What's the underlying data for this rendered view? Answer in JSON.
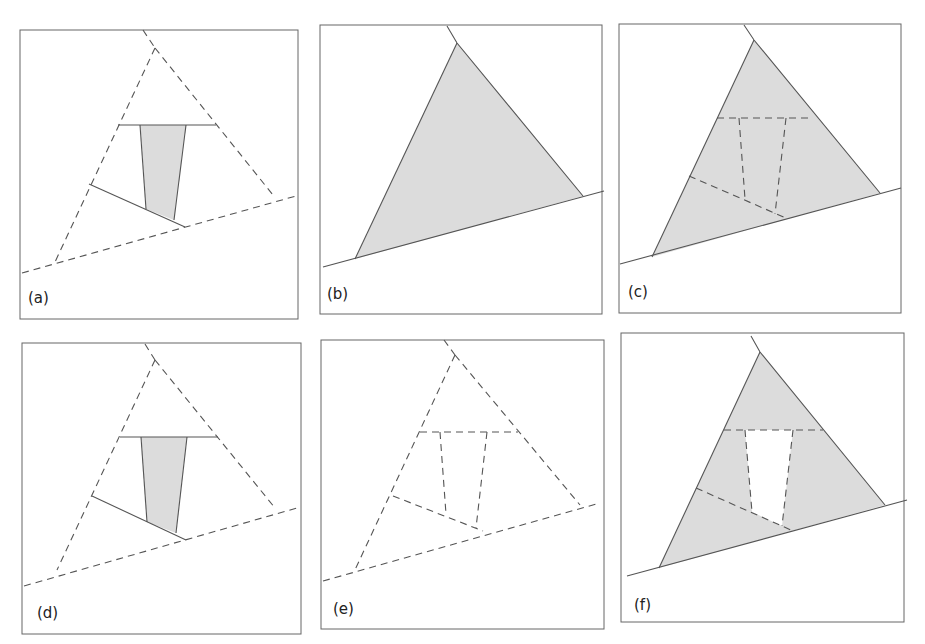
{
  "figure": {
    "page_marker": "",
    "panels": [
      {
        "id": "a",
        "label": "(a)",
        "description": "Dashed triangle with dashed baseline; inner solid horizontal and slanted segments; shaded trapezoid strip"
      },
      {
        "id": "b",
        "label": "(b)",
        "description": "Solid shaded triangle on solid baseline"
      },
      {
        "id": "c",
        "label": "(c)",
        "description": "Shaded triangle with dashed inner trapezoid and dashed dividing lines"
      },
      {
        "id": "d",
        "label": "(d)",
        "description": "Same as (a): dashed triangle with shaded trapezoid strip"
      },
      {
        "id": "e",
        "label": "(e)",
        "description": "All-dashed triangle with dashed inner trapezoid, no shading"
      },
      {
        "id": "f",
        "label": "(f)",
        "description": "Shaded triangle with white (unshaded) inner trapezoid outlined dashed"
      }
    ]
  },
  "colors": {
    "stroke": "#555555",
    "fill": "#dcdcdc",
    "frame": "#666666",
    "background": "#ffffff"
  }
}
